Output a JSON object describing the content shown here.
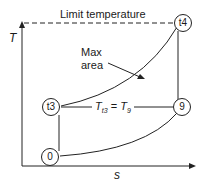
{
  "diagram": {
    "type": "T-s diagram",
    "title_label": "Limit temperature",
    "axis_y_label": "T",
    "axis_x_label": "s",
    "annotation": {
      "line1": "Max",
      "line2": "area"
    },
    "equation": {
      "lhs": "T",
      "lhs_sub": "t3",
      "eq": "=",
      "rhs": "T",
      "rhs_sub": "9"
    },
    "nodes": [
      {
        "id": "t4",
        "label": "t4"
      },
      {
        "id": "t3",
        "label": "t3"
      },
      {
        "id": "9",
        "label": "9"
      },
      {
        "id": "0",
        "label": "0"
      }
    ],
    "colors": {
      "line": "#222222",
      "text": "#1a1a1a"
    }
  }
}
